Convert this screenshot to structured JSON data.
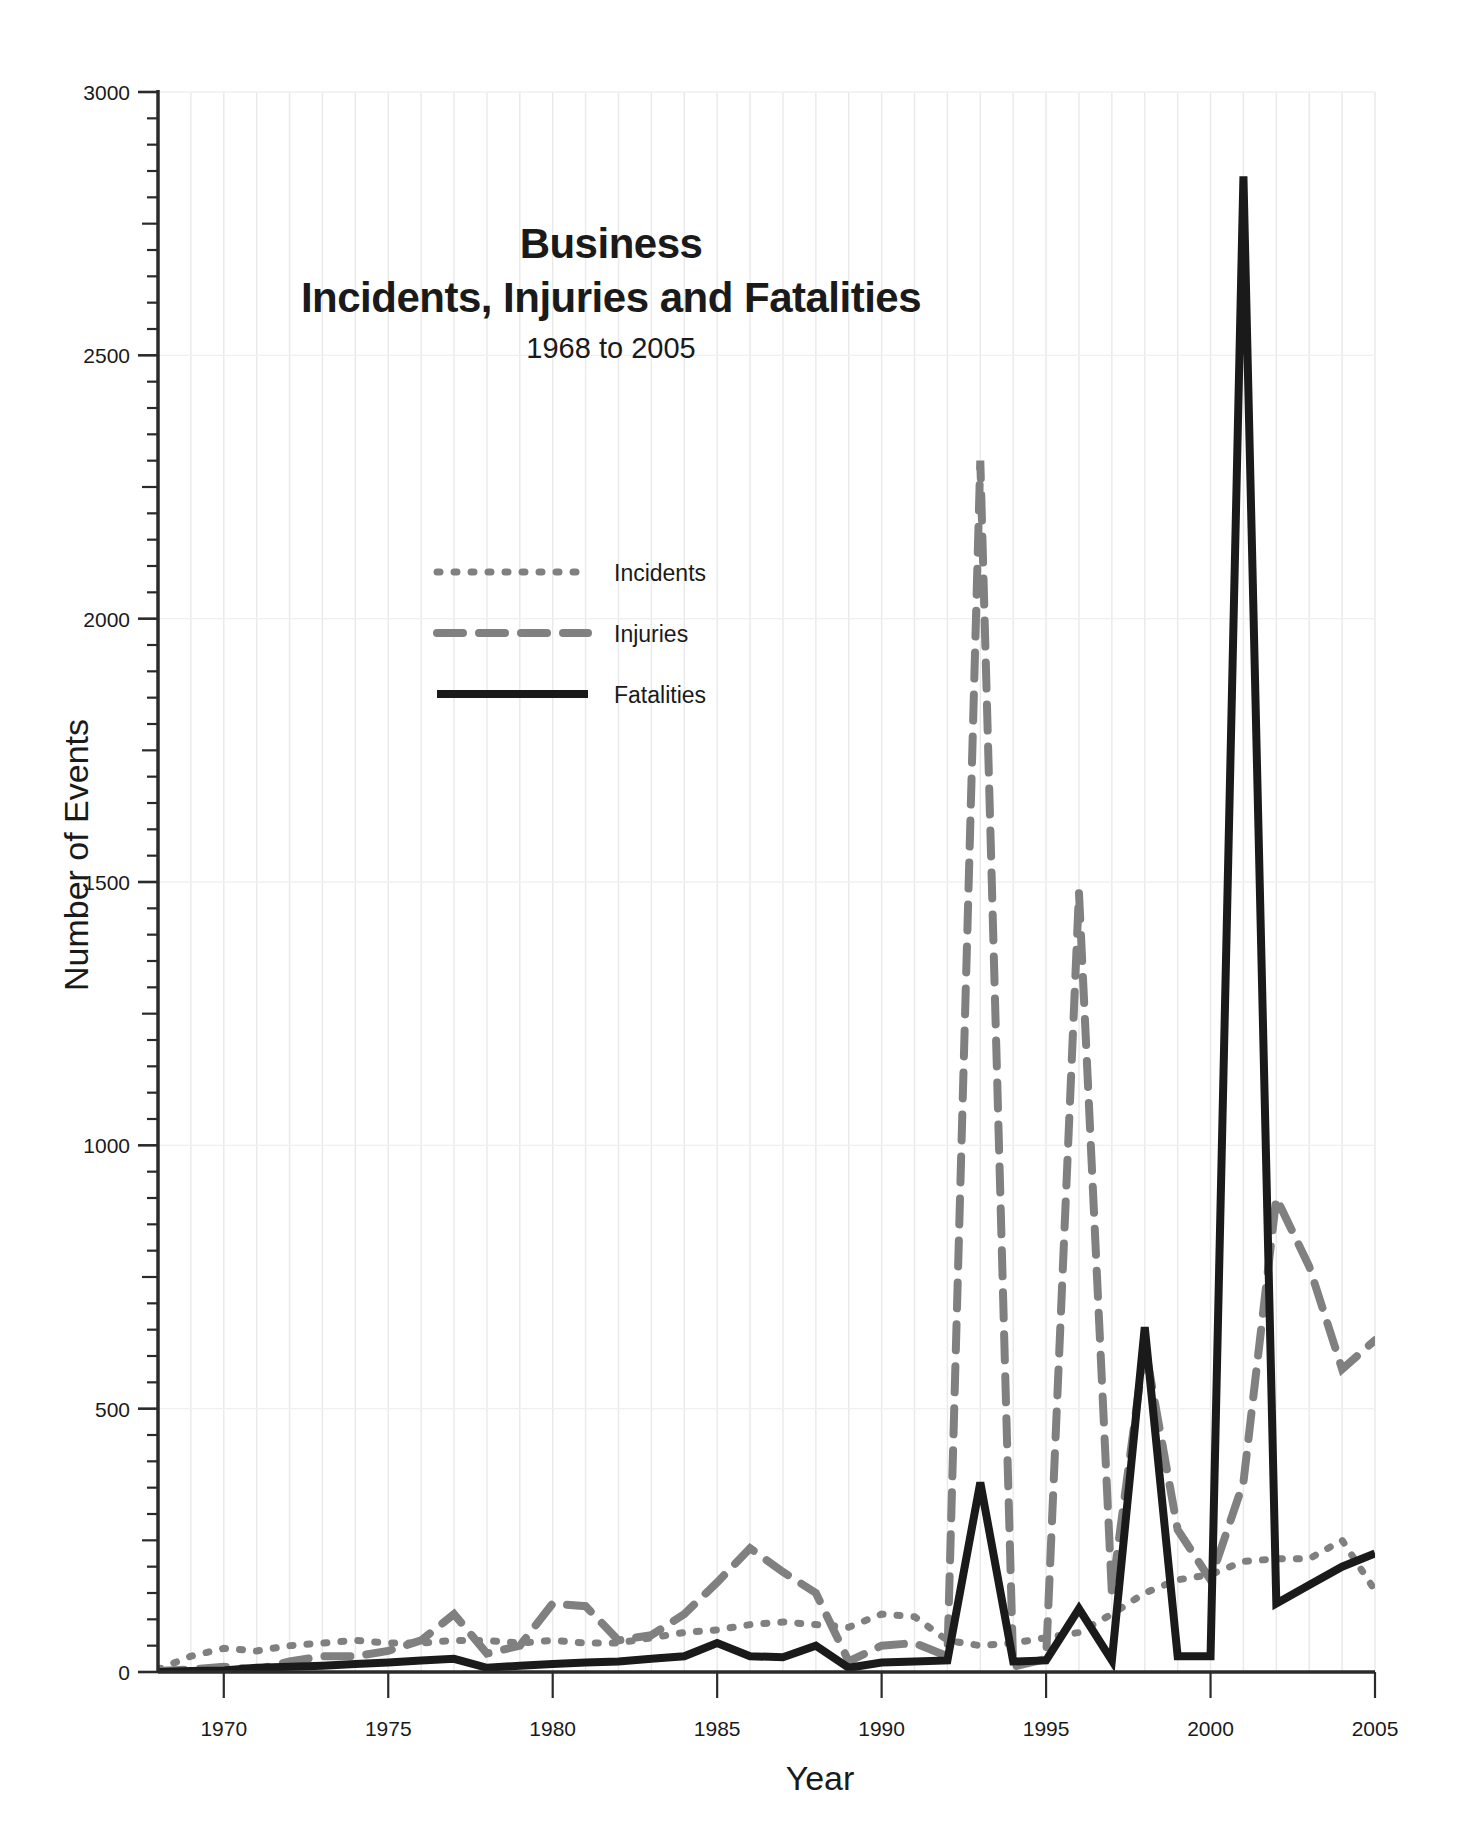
{
  "chart_data": {
    "type": "line",
    "title": "Business\nIncidents, Injuries and Fatalities",
    "title_line1": "Business",
    "title_line2": "Incidents, Injuries and Fatalities",
    "subtitle": "1968 to 2005",
    "xlabel": "Year",
    "ylabel": "Number of Events",
    "xlim": [
      1968,
      2005
    ],
    "ylim": [
      0,
      3000
    ],
    "ytick_labels": [
      "0",
      "500",
      "1000",
      "1500",
      "2000",
      "2500",
      "3000"
    ],
    "yticks": [
      0,
      500,
      1000,
      1500,
      2000,
      2500,
      3000
    ],
    "yminor_step": 50,
    "ymid_step": 250,
    "xtick_labels": [
      "1970",
      "1975",
      "1980",
      "1985",
      "1990",
      "1995",
      "2000",
      "2005"
    ],
    "xticks": [
      1970,
      1975,
      1980,
      1985,
      1990,
      1995,
      2000,
      2005
    ],
    "grid": "vertical-minor",
    "grid_color": "#e8e8e8",
    "legend_position": "upper-center-left",
    "x": [
      1968,
      1969,
      1970,
      1971,
      1972,
      1973,
      1974,
      1975,
      1976,
      1977,
      1978,
      1979,
      1980,
      1981,
      1982,
      1983,
      1984,
      1985,
      1986,
      1987,
      1988,
      1989,
      1990,
      1991,
      1992,
      1993,
      1994,
      1995,
      1996,
      1997,
      1998,
      1999,
      2000,
      2001,
      2002,
      2003,
      2004,
      2005
    ],
    "series": [
      {
        "name": "Incidents",
        "style": "dotted",
        "color": "#808080",
        "width": 7,
        "dash": "3,14",
        "values": [
          5,
          30,
          45,
          40,
          50,
          55,
          60,
          55,
          55,
          60,
          60,
          55,
          60,
          55,
          55,
          65,
          75,
          80,
          90,
          95,
          90,
          85,
          110,
          105,
          60,
          50,
          55,
          65,
          75,
          110,
          150,
          175,
          185,
          210,
          215,
          215,
          250,
          155
        ]
      },
      {
        "name": "Injuries",
        "style": "dashed",
        "color": "#808080",
        "width": 8,
        "dash": "26,16",
        "values": [
          2,
          5,
          10,
          5,
          20,
          30,
          30,
          40,
          60,
          110,
          35,
          50,
          130,
          125,
          60,
          70,
          110,
          170,
          235,
          190,
          150,
          20,
          50,
          55,
          30,
          2300,
          10,
          25,
          1480,
          150,
          620,
          270,
          175,
          360,
          900,
          770,
          575,
          630
        ]
      },
      {
        "name": "Fatalities",
        "style": "solid",
        "color": "#1a1a1a",
        "width": 8,
        "dash": "",
        "values": [
          0,
          2,
          3,
          8,
          10,
          12,
          15,
          18,
          22,
          25,
          8,
          12,
          15,
          18,
          20,
          25,
          30,
          55,
          30,
          28,
          50,
          8,
          18,
          20,
          22,
          360,
          20,
          22,
          120,
          22,
          655,
          30,
          30,
          2840,
          130,
          165,
          200,
          225
        ]
      }
    ],
    "legend": [
      {
        "label": "Incidents",
        "style": "dotted",
        "color": "#808080"
      },
      {
        "label": "Injuries",
        "style": "dashed",
        "color": "#808080"
      },
      {
        "label": "Fatalities",
        "style": "solid",
        "color": "#1a1a1a"
      }
    ]
  },
  "colors": {
    "gray_series": "#808080",
    "black_series": "#1a1a1a",
    "axis": "#2b2b2b",
    "gridline": "#e9e9e9",
    "background": "#ffffff"
  }
}
